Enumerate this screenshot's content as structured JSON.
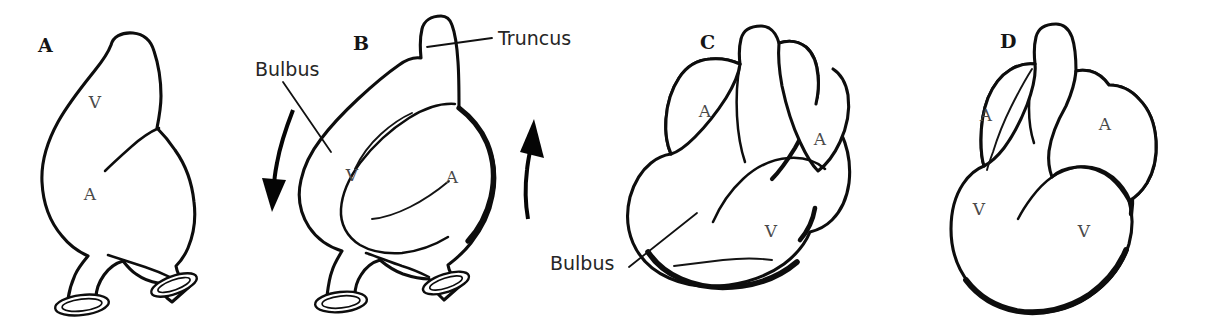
{
  "figure": {
    "width": 1205,
    "height": 327,
    "background_color": "#ffffff",
    "ink_color": "#0d0d0d",
    "style": "black-and-white line drawing"
  },
  "panels": [
    {
      "id": "A",
      "letter": "A",
      "letter_x": 38,
      "letter_y": 52,
      "description": "Straight heart tube, ventral view, with inflow vessels at base",
      "chamber_labels": [
        {
          "text": "V",
          "x": 95,
          "y": 108,
          "meaning": "ventricle"
        },
        {
          "text": "A",
          "x": 90,
          "y": 200,
          "meaning": "atrium"
        }
      ]
    },
    {
      "id": "B",
      "letter": "B",
      "letter_x": 353,
      "letter_y": 50,
      "description": "Looping heart tube with truncus and bulbus; curved arrows show direction of looping rotation",
      "chamber_labels": [
        {
          "text": "V",
          "x": 352,
          "y": 181,
          "meaning": "ventricle"
        },
        {
          "text": "A",
          "x": 452,
          "y": 183,
          "meaning": "atrium"
        }
      ],
      "callouts": [
        {
          "text": "Bulbus",
          "x": 255,
          "y": 76,
          "anchor": "start"
        },
        {
          "text": "Truncus",
          "x": 498,
          "y": 45,
          "anchor": "start"
        }
      ],
      "arrows": [
        {
          "name": "left-rotation-arrow",
          "direction": "down"
        },
        {
          "name": "right-rotation-arrow",
          "direction": "up"
        }
      ]
    },
    {
      "id": "C",
      "letter": "C",
      "letter_x": 700,
      "letter_y": 49,
      "description": "Further looped heart with paired atria flanking the outflow tract and a large bulbus",
      "chamber_labels": [
        {
          "text": "A",
          "x": 705,
          "y": 117,
          "meaning": "left atrium"
        },
        {
          "text": "A",
          "x": 820,
          "y": 145,
          "meaning": "right atrium"
        },
        {
          "text": "V",
          "x": 771,
          "y": 237,
          "meaning": "ventricle"
        }
      ],
      "callouts": [
        {
          "text": "Bulbus",
          "x": 550,
          "y": 270,
          "anchor": "start"
        }
      ]
    },
    {
      "id": "D",
      "letter": "D",
      "letter_x": 1000,
      "letter_y": 48,
      "description": "Definitive four-chambered heart shape with two atria and two ventricles",
      "chamber_labels": [
        {
          "text": "A",
          "x": 986,
          "y": 121,
          "meaning": "left atrium"
        },
        {
          "text": "A",
          "x": 1105,
          "y": 130,
          "meaning": "right atrium"
        },
        {
          "text": "V",
          "x": 979,
          "y": 215,
          "meaning": "left ventricle"
        },
        {
          "text": "V",
          "x": 1084,
          "y": 237,
          "meaning": "right ventricle"
        }
      ]
    }
  ],
  "labels": {
    "bulbus": "Bulbus",
    "truncus": "Truncus",
    "ventricle_abbr": "V",
    "atrium_abbr": "A",
    "panel_a": "A",
    "panel_b": "B",
    "panel_c": "C",
    "panel_d": "D"
  }
}
